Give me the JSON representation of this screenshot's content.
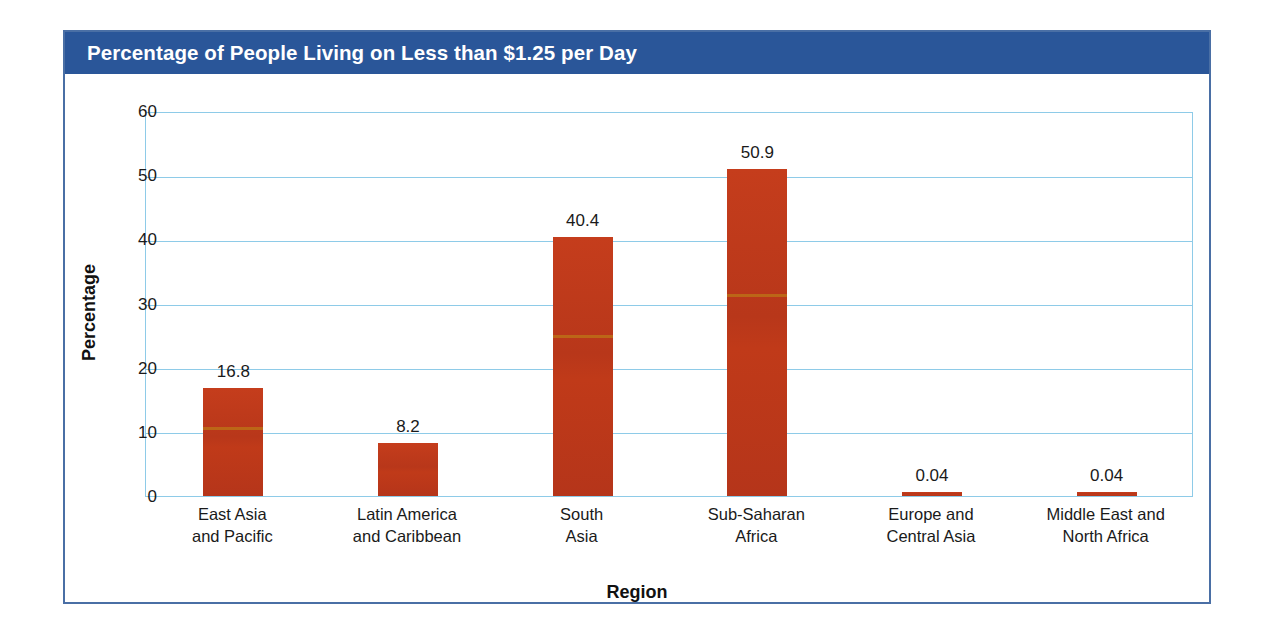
{
  "figure": {
    "title": "Percentage of People Living on Less than $1.25 per Day",
    "header_color": "#2a5699",
    "frame_color": "#4a6fa5",
    "bar_color": "#c0391a",
    "grid_color": "#8ecbe8"
  },
  "chart_data": {
    "type": "bar",
    "title": "Percentage of People Living on Less than $1.25 per Day",
    "xlabel": "Region",
    "ylabel": "Percentage",
    "ylim": [
      0,
      60
    ],
    "ytick_step": 10,
    "yticks": [
      "60",
      "50",
      "40",
      "30",
      "20",
      "10",
      "0"
    ],
    "grid": true,
    "legend": "none",
    "categories": [
      "East Asia and Pacific",
      "Latin America and Caribbean",
      "South Asia",
      "Sub-Saharan Africa",
      "Europe and Central Asia",
      "Middle East and North Africa"
    ],
    "category_lines": [
      [
        "East Asia",
        "and Pacific"
      ],
      [
        "Latin America",
        "and Caribbean"
      ],
      [
        "South",
        "Asia"
      ],
      [
        "Sub-Saharan",
        "Africa"
      ],
      [
        "Europe and",
        "Central Asia"
      ],
      [
        "Middle East and",
        "North Africa"
      ]
    ],
    "values": [
      16.8,
      8.2,
      40.4,
      50.9,
      0.04,
      0.04
    ],
    "value_labels": [
      "16.8",
      "8.2",
      "40.4",
      "50.9",
      "0.04",
      "0.04"
    ]
  }
}
